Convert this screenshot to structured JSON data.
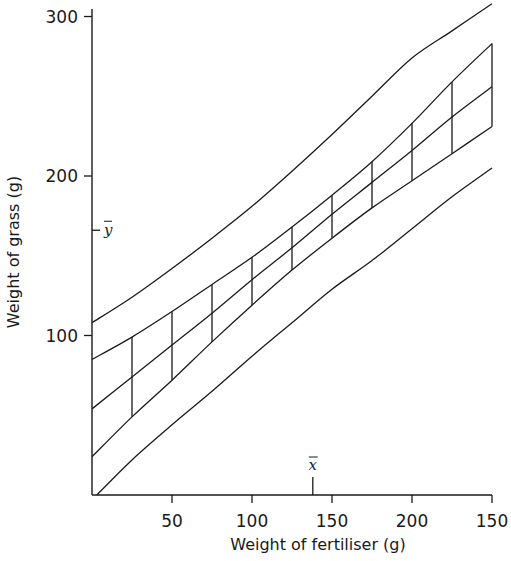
{
  "chart_data": {
    "type": "line",
    "title": "",
    "xlabel": "Weight of fertiliser (g)",
    "ylabel": "Weight of grass (g)",
    "xlim": [
      0,
      250
    ],
    "ylim": [
      0,
      300
    ],
    "x_ticks": [
      50,
      100,
      150,
      200,
      250
    ],
    "x_tick_labels": [
      "50",
      "100",
      "150",
      "200",
      "150"
    ],
    "y_ticks": [
      100,
      200,
      300
    ],
    "y_tick_labels": [
      "100",
      "200",
      "300"
    ],
    "grid": false,
    "legend": null,
    "annotations": [
      {
        "label": "x̄",
        "axis": "x",
        "value": 138
      },
      {
        "label": "ȳ",
        "axis": "y",
        "value": 166
      }
    ],
    "x": [
      0,
      25,
      50,
      75,
      100,
      125,
      150,
      175,
      200,
      225,
      250
    ],
    "series": [
      {
        "name": "Upper prediction limit",
        "role": "outer-upper",
        "values": [
          108,
          124,
          142,
          161,
          181,
          203,
          226,
          250,
          274,
          291,
          308
        ]
      },
      {
        "name": "Upper confidence limit",
        "role": "inner-upper",
        "values": [
          85,
          99,
          115,
          132,
          149,
          168,
          188,
          209,
          233,
          259,
          283
        ]
      },
      {
        "name": "Regression line",
        "role": "regression",
        "values": [
          54,
          74,
          94,
          114,
          135,
          155,
          176,
          196,
          216,
          237,
          256
        ]
      },
      {
        "name": "Lower confidence limit",
        "role": "inner-lower",
        "values": [
          24,
          49,
          72,
          96,
          119,
          141,
          161,
          180,
          197,
          214,
          231
        ]
      },
      {
        "name": "Lower prediction limit",
        "role": "outer-lower",
        "values": [
          0,
          22,
          44,
          65,
          87,
          108,
          129,
          147,
          167,
          187,
          205
        ]
      }
    ],
    "vertical_segments_x": [
      25,
      50,
      75,
      100,
      125,
      150,
      175,
      200,
      225,
      250
    ]
  }
}
